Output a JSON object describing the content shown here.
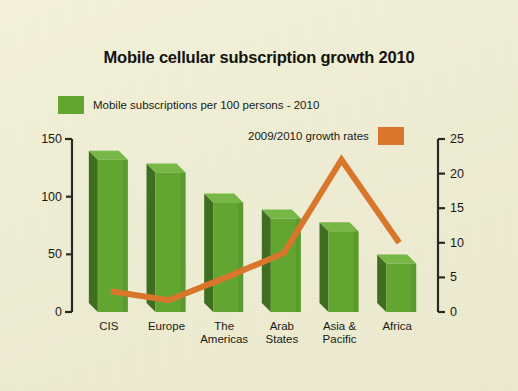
{
  "chart_data": {
    "type": "bar",
    "title": "Mobile cellular subscription growth 2010",
    "xlabel": "",
    "ylabel": "",
    "grid": false,
    "legend_position": "top",
    "categories": [
      "CIS",
      "Europe",
      "The\nAmericas",
      "Arab\nStates",
      "Asia &\nPacific",
      "Africa"
    ],
    "series": [
      {
        "name": "Mobile subscriptions per 100 persons - 2010",
        "type": "bar",
        "axis": "left",
        "color": "#62a631",
        "values": [
          132,
          121,
          95,
          81,
          70,
          42
        ]
      },
      {
        "name": "2009/2010 growth rates",
        "type": "line",
        "axis": "right",
        "color": "#d8762c",
        "values": [
          3.0,
          1.7,
          5.0,
          8.5,
          22.0,
          10.0
        ]
      }
    ],
    "left_axis": {
      "ticks": [
        "0",
        "50",
        "100",
        "150"
      ],
      "ylim": [
        0,
        150
      ]
    },
    "right_axis": {
      "ticks": [
        "0",
        "5",
        "10",
        "15",
        "20",
        "25"
      ],
      "ylim": [
        0,
        25
      ]
    }
  },
  "legend": {
    "items": [
      {
        "label": "Mobile subscriptions per 100 persons - 2010",
        "swatch": "green-swatch",
        "color": "#62a631"
      },
      {
        "label": "2009/2010 growth rates",
        "swatch": "orange-swatch",
        "color": "#d8762c"
      }
    ]
  },
  "axis_ticks": {
    "left": [
      {
        "text": "150",
        "value": 150
      },
      {
        "text": "100",
        "value": 100
      },
      {
        "text": "50",
        "value": 50
      },
      {
        "text": "0",
        "value": 0
      }
    ],
    "right": [
      {
        "text": "25",
        "value": 25
      },
      {
        "text": "20",
        "value": 20
      },
      {
        "text": "15",
        "value": 15
      },
      {
        "text": "10",
        "value": 10
      },
      {
        "text": "5",
        "value": 5
      },
      {
        "text": "0",
        "value": 0
      }
    ]
  },
  "categories": [
    {
      "text": "CIS"
    },
    {
      "text": "Europe"
    },
    {
      "text": "The\nAmericas"
    },
    {
      "text": "Arab\nStates"
    },
    {
      "text": "Asia &\nPacific"
    },
    {
      "text": "Africa"
    }
  ],
  "colors": {
    "background": "#f0eed4",
    "bar_face": "#62a631",
    "bar_side": "#3f6e20",
    "bar_top": "#76b745",
    "line": "#d8762c",
    "axis": "#2b2a22",
    "text": "#1b1a14"
  }
}
